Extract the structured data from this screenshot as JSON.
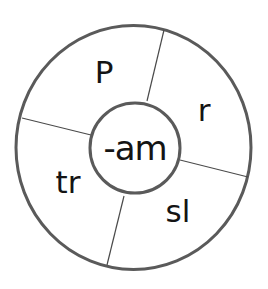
{
  "wheel": {
    "rime": "-am",
    "onsets": [
      {
        "text": "P",
        "position": "top-left"
      },
      {
        "text": "r",
        "position": "top-right"
      },
      {
        "text": "sl",
        "position": "bottom-right"
      },
      {
        "text": "tr",
        "position": "bottom-left"
      }
    ],
    "colors": {
      "outer_ring": "#5a5a5a",
      "inner_ring": "#5a5a5a",
      "dividers": "#4a4a4a",
      "text": "#141414",
      "background": "#ffffff"
    }
  }
}
